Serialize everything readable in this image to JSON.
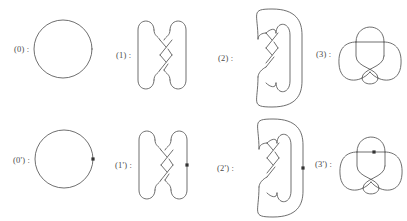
{
  "figure": {
    "stroke_color": "#555555",
    "basepoint_color": "#333333",
    "background_color": "#ffffff",
    "rows": [
      {
        "name": "unbased-row",
        "panels": [
          {
            "id": "0",
            "label": "(0) :",
            "knot": "unknot-circle",
            "basepoint": false
          },
          {
            "id": "1",
            "label": "(1) :",
            "knot": "twisted-braid-closure",
            "basepoint": false
          },
          {
            "id": "2",
            "label": "(2) :",
            "knot": "clasped-long-loop",
            "basepoint": false
          },
          {
            "id": "3",
            "label": "(3) :",
            "knot": "trefoil",
            "basepoint": false
          }
        ]
      },
      {
        "name": "based-row",
        "panels": [
          {
            "id": "0p",
            "label": "(0') :",
            "knot": "unknot-circle",
            "basepoint": true
          },
          {
            "id": "1p",
            "label": "(1') :",
            "knot": "twisted-braid-closure",
            "basepoint": true
          },
          {
            "id": "2p",
            "label": "(2') :",
            "knot": "clasped-long-loop",
            "basepoint": true
          },
          {
            "id": "3p",
            "label": "(3') :",
            "knot": "trefoil",
            "basepoint": true
          }
        ]
      }
    ]
  }
}
